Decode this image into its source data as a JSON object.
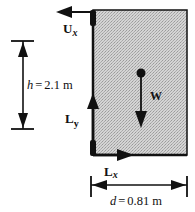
{
  "diagram": {
    "colors": {
      "block_fill": "#c8c8c8",
      "ink": "#111111",
      "background": "#ffffff"
    },
    "forces": {
      "Ux": {
        "symbol": "U",
        "subscript": "x",
        "direction": "left"
      },
      "Ly": {
        "symbol": "L",
        "subscript": "y",
        "direction": "up"
      },
      "Lx": {
        "symbol": "L",
        "subscript": "x",
        "direction": "right"
      },
      "W": {
        "symbol": "W",
        "direction": "down"
      }
    },
    "dimensions": {
      "height": {
        "variable": "h",
        "equals": "=",
        "value": "2.1",
        "unit": "m"
      },
      "width": {
        "variable": "d",
        "equals": "=",
        "value": "0.81",
        "unit": "m"
      }
    }
  }
}
